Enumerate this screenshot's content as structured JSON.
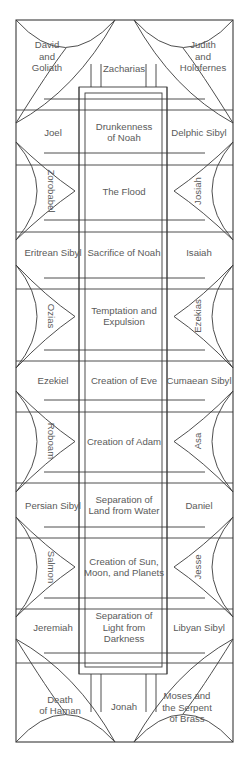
{
  "corners": {
    "top_left": [
      "David",
      "and",
      "Goliath"
    ],
    "top_right": [
      "Judith",
      "and",
      "Holofernes"
    ],
    "bottom_left": [
      "Death",
      "of Haman"
    ],
    "bottom_right": [
      "Moses and",
      "the Serpent",
      "of Brass"
    ]
  },
  "end_figures": {
    "top": "Zacharias",
    "bottom": "Jonah"
  },
  "rows": [
    {
      "type": "seer",
      "left": "Joel",
      "center": [
        "Drunkenness",
        "of Noah"
      ],
      "right": "Delphic Sibyl"
    },
    {
      "type": "lunette",
      "left": "Zorobabel",
      "center": [
        "The Flood"
      ],
      "right": "Josiah"
    },
    {
      "type": "seer",
      "left": "Eritrean Sibyl",
      "center": [
        "Sacrifice of Noah"
      ],
      "right": "Isaiah"
    },
    {
      "type": "lunette",
      "left": "Ozias",
      "center": [
        "Temptation and",
        "Expulsion"
      ],
      "right": "Ezekias"
    },
    {
      "type": "seer",
      "left": "Ezekiel",
      "center": [
        "Creation of Eve"
      ],
      "right": "Cumaean Sibyl"
    },
    {
      "type": "lunette",
      "left": "Roboam",
      "center": [
        "Creation of Adam"
      ],
      "right": "Asa"
    },
    {
      "type": "seer",
      "left": "Persian Sibyl",
      "center": [
        "Separation of",
        "Land from Water"
      ],
      "right": "Daniel"
    },
    {
      "type": "lunette",
      "left": "Salmon",
      "center": [
        "Creation of Sun,",
        "Moon, and Planets"
      ],
      "right": "Jesse"
    },
    {
      "type": "seer",
      "left": "Jeremiah",
      "center": [
        "Separation of",
        "Light from",
        "Darkness"
      ],
      "right": "Libyan Sibyl"
    }
  ]
}
